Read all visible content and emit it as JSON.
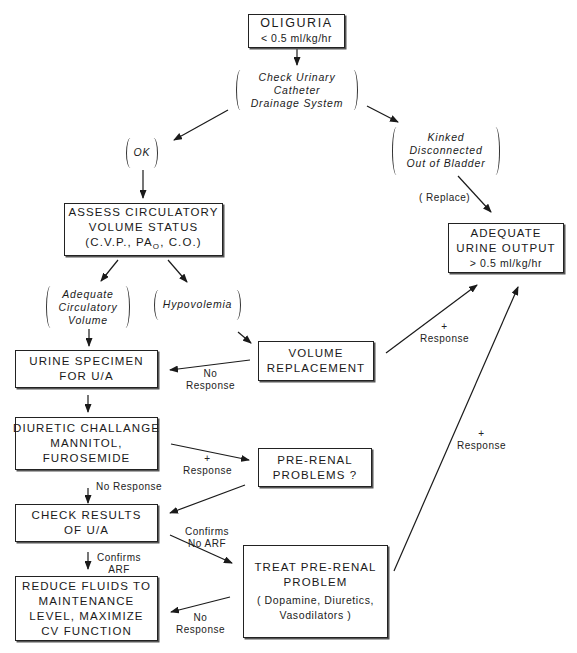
{
  "diagram": {
    "nodes": {
      "oliguria": {
        "lines": [
          "OLIGURIA",
          "< 0.5 ml/kg/hr"
        ]
      },
      "check_catheter": {
        "lines": [
          "Check Urinary",
          "Catheter",
          "Drainage System"
        ]
      },
      "ok": {
        "lines": [
          "OK"
        ]
      },
      "kinked": {
        "lines": [
          "Kinked",
          "Disconnected",
          "Out of Bladder"
        ]
      },
      "assess": {
        "lines": [
          "ASSESS CIRCULATORY",
          "VOLUME STATUS",
          "(C.V.P., PA",
          "O",
          ", C.O.)"
        ]
      },
      "adequate_output": {
        "lines": [
          "ADEQUATE",
          "URINE OUTPUT",
          "> 0.5 ml/kg/hr"
        ]
      },
      "adequate_volume": {
        "lines": [
          "Adequate",
          "Circulatory",
          "Volume"
        ]
      },
      "hypovolemia": {
        "lines": [
          "Hypovolemia"
        ]
      },
      "urine_specimen": {
        "lines": [
          "URINE SPECIMEN",
          "FOR U/A"
        ]
      },
      "volume_replacement": {
        "lines": [
          "VOLUME",
          "REPLACEMENT"
        ]
      },
      "diuretic": {
        "lines": [
          "DIURETIC CHALLANGE",
          "MANNITOL,",
          "FUROSEMIDE"
        ]
      },
      "prerenal_problems": {
        "lines": [
          "PRE-RENAL",
          "PROBLEMS ?"
        ]
      },
      "check_results": {
        "lines": [
          "CHECK RESULTS",
          "OF U/A"
        ]
      },
      "treat_prerenal": {
        "lines": [
          "TREAT PRE-RENAL",
          "PROBLEM",
          "( Dopamine, Diuretics,",
          "Vasodilators )"
        ]
      },
      "reduce_fluids": {
        "lines": [
          "REDUCE FLUIDS TO",
          "MAINTENANCE",
          "LEVEL, MAXIMIZE",
          "CV FUNCTION"
        ]
      }
    },
    "edge_labels": {
      "replace": "( Replace)",
      "vol_response": [
        "+",
        "Response"
      ],
      "vol_no_response": [
        "No",
        "Response"
      ],
      "diuretic_response": [
        "+",
        "Response"
      ],
      "diuretic_no_response": "No Response",
      "confirms_arf": [
        "Confirms",
        "ARF"
      ],
      "confirms_no_arf": [
        "Confirms",
        "No ARF"
      ],
      "treat_response": [
        "+",
        "Response"
      ],
      "treat_no_response": [
        "No",
        "Response"
      ]
    },
    "colors": {
      "ink": "#1a1a1a",
      "background": "#ffffff"
    }
  }
}
